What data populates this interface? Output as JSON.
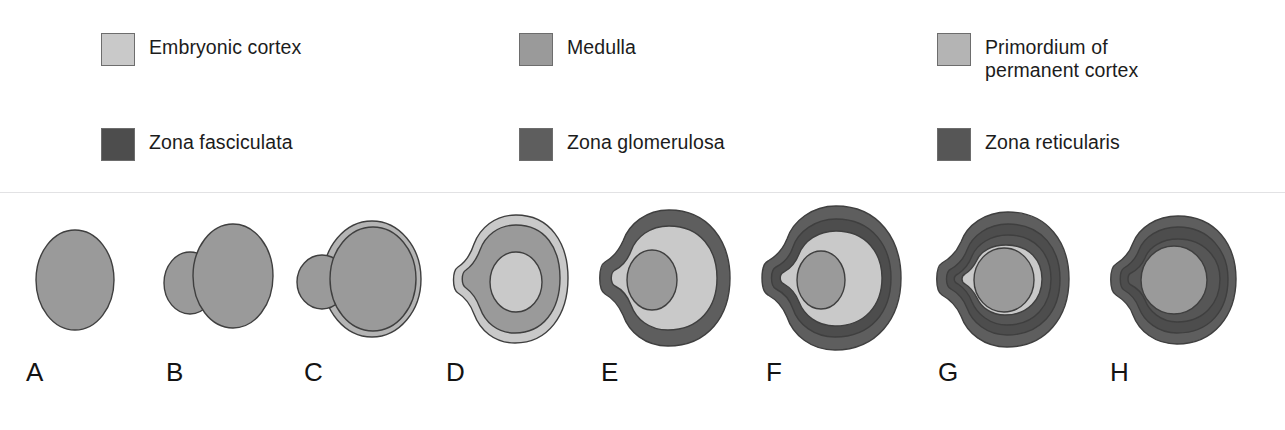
{
  "figure": {
    "kind": "adrenal-gland-development-stages",
    "colors": {
      "embryonic_cortex": "#c9c9c9",
      "medulla": "#9a9a9a",
      "primordium_permanent_cortex": "#b4b4b4",
      "zona_fasciculata": "#4d4d4d",
      "zona_glomerulosa": "#5e5e5e",
      "zona_reticularis": "#565656",
      "outline": "#3f3f3f",
      "background": "#ffffff",
      "divider": "#e2e2e4",
      "text": "#1c1c1c"
    }
  },
  "legend": {
    "items": [
      {
        "id": "embryonic-cortex",
        "label": "Embryonic cortex",
        "color": "#c9c9c9"
      },
      {
        "id": "medulla",
        "label": "Medulla",
        "color": "#9a9a9a"
      },
      {
        "id": "primordium-of-permanent-cortex",
        "label": "Primordium of\npermanent cortex",
        "color": "#b4b4b4"
      },
      {
        "id": "zona-fasciculata",
        "label": "Zona fasciculata",
        "color": "#4d4d4d"
      },
      {
        "id": "zona-glomerulosa",
        "label": "Zona glomerulosa",
        "color": "#5e5e5e"
      },
      {
        "id": "zona-reticularis",
        "label": "Zona reticularis",
        "color": "#565656"
      }
    ]
  },
  "stages": [
    {
      "letter": "A",
      "structures": [
        "medulla"
      ]
    },
    {
      "letter": "B",
      "structures": [
        "medulla",
        "medulla-lobe"
      ]
    },
    {
      "letter": "C",
      "structures": [
        "primordium-of-permanent-cortex",
        "medulla",
        "medulla-lobe"
      ]
    },
    {
      "letter": "D",
      "structures": [
        "primordium-of-permanent-cortex",
        "embryonic-cortex",
        "medulla"
      ]
    },
    {
      "letter": "E",
      "structures": [
        "zona-glomerulosa",
        "primordium-of-permanent-cortex",
        "embryonic-cortex",
        "medulla"
      ]
    },
    {
      "letter": "F",
      "structures": [
        "zona-glomerulosa",
        "zona-fasciculata",
        "primordium-of-permanent-cortex",
        "embryonic-cortex",
        "medulla"
      ]
    },
    {
      "letter": "G",
      "structures": [
        "zona-glomerulosa",
        "zona-fasciculata",
        "zona-reticularis",
        "embryonic-cortex",
        "medulla"
      ]
    },
    {
      "letter": "H",
      "structures": [
        "zona-glomerulosa",
        "zona-fasciculata",
        "zona-reticularis",
        "medulla"
      ]
    }
  ]
}
